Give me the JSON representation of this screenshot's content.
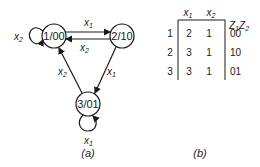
{
  "diagram_a": {
    "caption": "(a)",
    "states": [
      {
        "id": "1",
        "label": "1/00"
      },
      {
        "id": "2",
        "label": "2/10"
      },
      {
        "id": "3",
        "label": "3/01"
      }
    ],
    "transitions": [
      {
        "from": "1",
        "to": "1",
        "input": "x",
        "sub": "2"
      },
      {
        "from": "1",
        "to": "2",
        "input": "x",
        "sub": "1"
      },
      {
        "from": "2",
        "to": "1",
        "input": "x",
        "sub": "2"
      },
      {
        "from": "2",
        "to": "3",
        "input": "x",
        "sub": "1"
      },
      {
        "from": "3",
        "to": "1",
        "input": "x",
        "sub": "2"
      },
      {
        "from": "3",
        "to": "3",
        "input": "x",
        "sub": "1"
      }
    ]
  },
  "table_b": {
    "caption": "(b)",
    "col_headers": [
      {
        "base": "x",
        "sub": "1"
      },
      {
        "base": "x",
        "sub": "2"
      }
    ],
    "output_header": {
      "z1": "Z",
      "s1": "1",
      "z2": "Z",
      "s2": "2"
    },
    "rows": [
      {
        "state": "1",
        "x1": "2",
        "x2": "1",
        "out": "00"
      },
      {
        "state": "2",
        "x1": "3",
        "x2": "1",
        "out": "10"
      },
      {
        "state": "3",
        "x1": "3",
        "x2": "1",
        "out": "01"
      }
    ]
  }
}
